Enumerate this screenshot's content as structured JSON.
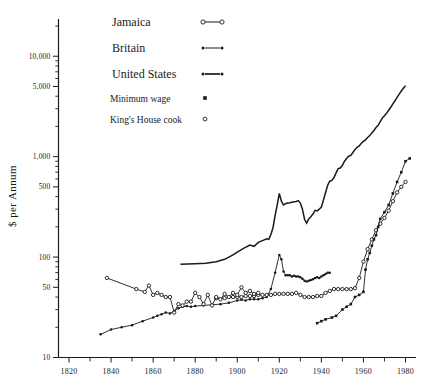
{
  "chart_data": {
    "type": "line",
    "title": "",
    "xlabel": "",
    "ylabel": "$ per Annum",
    "yscale": "log",
    "ylim": [
      10,
      20000
    ],
    "xlim": [
      1815,
      1985
    ],
    "grid": false,
    "legend_position": "top-center",
    "y_ticks_labeled": [
      "10",
      "50",
      "100",
      "500",
      "1,000",
      "5,000",
      "10,000"
    ],
    "y_tick_values": [
      10,
      50,
      100,
      500,
      1000,
      5000,
      10000
    ],
    "y_minor_ticks": [
      20,
      30,
      40,
      60,
      70,
      80,
      90,
      200,
      300,
      400,
      600,
      700,
      800,
      900,
      2000,
      3000,
      4000,
      6000,
      7000,
      8000,
      9000,
      20000
    ],
    "x_ticks_labeled": [
      "1820",
      "1840",
      "1860",
      "1880",
      "1900",
      "1920",
      "1940",
      "1960",
      "1980"
    ],
    "x_tick_values": [
      1820,
      1840,
      1860,
      1880,
      1900,
      1920,
      1940,
      1960,
      1980
    ],
    "x_minor_ticks": [
      1830,
      1850,
      1870,
      1890,
      1910,
      1930,
      1950,
      1970
    ],
    "legend": [
      {
        "name": "Jamaica",
        "marker": "open-circle",
        "line": true,
        "size": "large"
      },
      {
        "name": "Britain",
        "marker": "dot",
        "line": true,
        "size": "large"
      },
      {
        "name": "United States",
        "marker": "dot",
        "line": true,
        "size": "large"
      },
      {
        "name": "Minimum wage",
        "marker": "filled-square",
        "line": false,
        "size": "small"
      },
      {
        "name": "King's House cook",
        "marker": "open-circle",
        "line": false,
        "size": "small"
      }
    ],
    "series": [
      {
        "name": "United States",
        "marker": "none",
        "points": [
          [
            1873,
            85
          ],
          [
            1880,
            86
          ],
          [
            1885,
            87
          ],
          [
            1890,
            90
          ],
          [
            1894,
            95
          ],
          [
            1898,
            105
          ],
          [
            1900,
            112
          ],
          [
            1903,
            122
          ],
          [
            1906,
            132
          ],
          [
            1908,
            128
          ],
          [
            1910,
            140
          ],
          [
            1912,
            146
          ],
          [
            1914,
            152
          ],
          [
            1915,
            150
          ],
          [
            1916,
            168
          ],
          [
            1917,
            196
          ],
          [
            1918,
            260
          ],
          [
            1919,
            330
          ],
          [
            1920,
            430
          ],
          [
            1921,
            360
          ],
          [
            1922,
            330
          ],
          [
            1923,
            340
          ],
          [
            1924,
            345
          ],
          [
            1925,
            348
          ],
          [
            1926,
            352
          ],
          [
            1927,
            355
          ],
          [
            1928,
            358
          ],
          [
            1929,
            365
          ],
          [
            1930,
            345
          ],
          [
            1931,
            300
          ],
          [
            1932,
            238
          ],
          [
            1933,
            218
          ],
          [
            1934,
            240
          ],
          [
            1935,
            252
          ],
          [
            1936,
            268
          ],
          [
            1937,
            292
          ],
          [
            1938,
            288
          ],
          [
            1939,
            300
          ],
          [
            1940,
            315
          ],
          [
            1941,
            370
          ],
          [
            1942,
            440
          ],
          [
            1943,
            520
          ],
          [
            1944,
            570
          ],
          [
            1945,
            580
          ],
          [
            1946,
            620
          ],
          [
            1947,
            690
          ],
          [
            1948,
            760
          ],
          [
            1949,
            770
          ],
          [
            1950,
            820
          ],
          [
            1951,
            900
          ],
          [
            1952,
            960
          ],
          [
            1953,
            1010
          ],
          [
            1954,
            1030
          ],
          [
            1955,
            1100
          ],
          [
            1956,
            1180
          ],
          [
            1957,
            1240
          ],
          [
            1958,
            1280
          ],
          [
            1959,
            1360
          ],
          [
            1960,
            1420
          ],
          [
            1961,
            1470
          ],
          [
            1962,
            1550
          ],
          [
            1963,
            1620
          ],
          [
            1964,
            1720
          ],
          [
            1965,
            1820
          ],
          [
            1966,
            1950
          ],
          [
            1967,
            2050
          ],
          [
            1968,
            2230
          ],
          [
            1969,
            2420
          ],
          [
            1970,
            2560
          ],
          [
            1971,
            2700
          ],
          [
            1972,
            2900
          ],
          [
            1973,
            3100
          ],
          [
            1974,
            3350
          ],
          [
            1975,
            3600
          ],
          [
            1976,
            3900
          ],
          [
            1977,
            4200
          ],
          [
            1978,
            4500
          ],
          [
            1979,
            4800
          ],
          [
            1980,
            5100
          ]
        ]
      },
      {
        "name": "Britain",
        "marker": "dot",
        "points": [
          [
            1835,
            17
          ],
          [
            1840,
            19
          ],
          [
            1845,
            20
          ],
          [
            1850,
            21
          ],
          [
            1855,
            23
          ],
          [
            1860,
            25
          ],
          [
            1862,
            26
          ],
          [
            1864,
            27
          ],
          [
            1866,
            28
          ],
          [
            1868,
            27.5
          ],
          [
            1870,
            29
          ],
          [
            1872,
            31
          ],
          [
            1874,
            32
          ],
          [
            1876,
            32.5
          ],
          [
            1878,
            32
          ],
          [
            1880,
            32.5
          ],
          [
            1884,
            33
          ],
          [
            1888,
            33.5
          ],
          [
            1892,
            34
          ],
          [
            1896,
            35
          ],
          [
            1900,
            37
          ],
          [
            1902,
            37.5
          ],
          [
            1904,
            37
          ],
          [
            1906,
            38
          ],
          [
            1908,
            38
          ],
          [
            1910,
            38
          ],
          [
            1912,
            39
          ],
          [
            1914,
            40
          ],
          [
            1916,
            48
          ],
          [
            1918,
            70
          ],
          [
            1920,
            105
          ],
          [
            1921,
            95
          ],
          [
            1922,
            72
          ],
          [
            1923,
            66
          ],
          [
            1924,
            66
          ],
          [
            1925,
            66
          ],
          [
            1926,
            64
          ],
          [
            1927,
            65
          ],
          [
            1928,
            64
          ],
          [
            1929,
            64
          ],
          [
            1930,
            63
          ],
          [
            1931,
            61
          ],
          [
            1932,
            58
          ],
          [
            1933,
            57
          ],
          [
            1934,
            58
          ],
          [
            1935,
            59
          ],
          [
            1936,
            60
          ],
          [
            1937,
            62
          ],
          [
            1938,
            63
          ],
          [
            1939,
            62
          ],
          [
            1940,
            64
          ],
          [
            1941,
            66
          ],
          [
            1942,
            68
          ],
          [
            1943,
            70
          ],
          [
            1944,
            70
          ]
        ]
      },
      {
        "name": "Jamaica",
        "marker": "open-circle",
        "points": [
          [
            1890,
            39
          ],
          [
            1894,
            39
          ],
          [
            1898,
            40
          ],
          [
            1900,
            40
          ],
          [
            1902,
            40
          ],
          [
            1904,
            41
          ],
          [
            1906,
            41
          ],
          [
            1908,
            41
          ],
          [
            1910,
            42
          ],
          [
            1912,
            42
          ],
          [
            1914,
            42
          ],
          [
            1916,
            42
          ],
          [
            1918,
            43
          ],
          [
            1920,
            43
          ],
          [
            1922,
            43
          ],
          [
            1924,
            43
          ],
          [
            1926,
            43
          ],
          [
            1928,
            44
          ],
          [
            1930,
            42
          ],
          [
            1932,
            40
          ],
          [
            1934,
            40
          ],
          [
            1936,
            40
          ],
          [
            1938,
            41
          ],
          [
            1940,
            41
          ],
          [
            1942,
            44
          ],
          [
            1944,
            46
          ],
          [
            1946,
            48
          ],
          [
            1948,
            48
          ],
          [
            1950,
            48
          ],
          [
            1952,
            48
          ],
          [
            1954,
            48
          ],
          [
            1956,
            49
          ],
          [
            1958,
            62
          ],
          [
            1960,
            90
          ],
          [
            1962,
            120
          ],
          [
            1964,
            150
          ],
          [
            1966,
            185
          ],
          [
            1968,
            215
          ],
          [
            1970,
            245
          ],
          [
            1972,
            290
          ],
          [
            1974,
            360
          ],
          [
            1976,
            440
          ],
          [
            1978,
            500
          ],
          [
            1980,
            560
          ]
        ]
      },
      {
        "name": "Minimum wage",
        "marker": "filled-square",
        "points": [
          [
            1938,
            22
          ],
          [
            1940,
            23
          ],
          [
            1942,
            24
          ],
          [
            1945,
            25
          ],
          [
            1947,
            26
          ],
          [
            1950,
            30
          ],
          [
            1952,
            32
          ],
          [
            1954,
            34
          ],
          [
            1956,
            40
          ],
          [
            1958,
            42
          ],
          [
            1960,
            45
          ],
          [
            1961,
            75
          ],
          [
            1962,
            95
          ],
          [
            1963,
            110
          ],
          [
            1964,
            130
          ],
          [
            1965,
            150
          ],
          [
            1966,
            165
          ],
          [
            1967,
            200
          ],
          [
            1968,
            240
          ],
          [
            1970,
            280
          ],
          [
            1972,
            330
          ],
          [
            1974,
            430
          ],
          [
            1976,
            560
          ],
          [
            1978,
            700
          ],
          [
            1980,
            900
          ],
          [
            1982,
            960
          ]
        ]
      },
      {
        "name": "King's House cook",
        "marker": "open-circle",
        "points": [
          [
            1838,
            62
          ],
          [
            1852,
            48
          ],
          [
            1856,
            45
          ],
          [
            1858,
            52
          ],
          [
            1860,
            42
          ],
          [
            1862,
            44
          ],
          [
            1864,
            42
          ],
          [
            1866,
            40
          ],
          [
            1868,
            40
          ],
          [
            1870,
            28
          ],
          [
            1872,
            34
          ],
          [
            1874,
            33
          ],
          [
            1876,
            36
          ],
          [
            1878,
            36
          ],
          [
            1880,
            44
          ],
          [
            1882,
            40
          ],
          [
            1884,
            34
          ],
          [
            1886,
            42
          ],
          [
            1888,
            33
          ],
          [
            1890,
            40
          ],
          [
            1892,
            38
          ],
          [
            1894,
            43
          ],
          [
            1896,
            40
          ],
          [
            1898,
            44
          ],
          [
            1900,
            42
          ],
          [
            1902,
            50
          ],
          [
            1904,
            44
          ],
          [
            1906,
            46
          ],
          [
            1908,
            43
          ],
          [
            1910,
            44
          ]
        ]
      }
    ]
  }
}
